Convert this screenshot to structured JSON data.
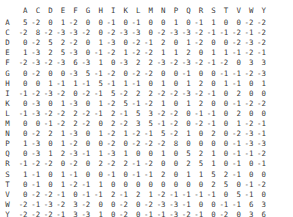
{
  "matrix": {
    "columns": [
      "A",
      "C",
      "D",
      "E",
      "F",
      "G",
      "H",
      "I",
      "K",
      "L",
      "M",
      "N",
      "P",
      "Q",
      "R",
      "S",
      "T",
      "V",
      "W",
      "Y"
    ],
    "rows": [
      {
        "label": "A",
        "values": [
          5,
          -2,
          0,
          1,
          -2,
          0,
          0,
          -1,
          0,
          -1,
          0,
          0,
          1,
          0,
          -1,
          1,
          0,
          0,
          -2,
          -2
        ]
      },
      {
        "label": "C",
        "values": [
          -2,
          8,
          -2,
          -3,
          -3,
          -2,
          0,
          -2,
          -3,
          -3,
          0,
          -2,
          -3,
          -3,
          -2,
          -1,
          -1,
          -2,
          -1,
          -2
        ]
      },
      {
        "label": "D",
        "values": [
          0,
          -2,
          5,
          2,
          -2,
          0,
          1,
          -3,
          0,
          -2,
          -1,
          2,
          0,
          1,
          -2,
          0,
          0,
          -2,
          -3,
          -2
        ]
      },
      {
        "label": "E",
        "values": [
          1,
          -3,
          2,
          5,
          -3,
          0,
          -1,
          -2,
          1,
          -2,
          -2,
          1,
          1,
          2,
          0,
          1,
          1,
          -1,
          -2,
          -1
        ]
      },
      {
        "label": "F",
        "values": [
          -2,
          -3,
          -2,
          -3,
          6,
          -3,
          1,
          0,
          -3,
          2,
          2,
          -3,
          -2,
          -3,
          -2,
          -1,
          -2,
          0,
          3,
          3
        ]
      },
      {
        "label": "G",
        "values": [
          0,
          -2,
          0,
          0,
          -3,
          5,
          -1,
          -2,
          0,
          -2,
          -2,
          0,
          0,
          -1,
          0,
          0,
          -1,
          -1,
          -2,
          -3
        ]
      },
      {
        "label": "H",
        "values": [
          0,
          0,
          1,
          -1,
          1,
          -1,
          5,
          -1,
          1,
          -1,
          0,
          1,
          0,
          1,
          2,
          0,
          1,
          -1,
          0,
          1
        ]
      },
      {
        "label": "I",
        "values": [
          -1,
          -2,
          -3,
          -2,
          0,
          -2,
          -1,
          5,
          -2,
          2,
          2,
          -2,
          -2,
          -3,
          -2,
          -1,
          0,
          2,
          0,
          0
        ]
      },
      {
        "label": "K",
        "values": [
          0,
          -3,
          0,
          1,
          -3,
          0,
          1,
          -2,
          5,
          -1,
          -2,
          1,
          0,
          1,
          2,
          0,
          0,
          -1,
          -2,
          -2
        ]
      },
      {
        "label": "L",
        "values": [
          -1,
          -3,
          -2,
          -2,
          2,
          -2,
          -1,
          2,
          -1,
          5,
          3,
          -2,
          -2,
          0,
          -1,
          -1,
          0,
          2,
          0,
          0
        ]
      },
      {
        "label": "M",
        "values": [
          0,
          0,
          -1,
          -2,
          2,
          -2,
          0,
          2,
          -2,
          3,
          5,
          -1,
          -2,
          0,
          -2,
          -1,
          0,
          1,
          -2,
          -1
        ]
      },
      {
        "label": "N",
        "values": [
          0,
          -2,
          2,
          1,
          -3,
          0,
          1,
          -2,
          1,
          -2,
          -1,
          5,
          -2,
          1,
          0,
          2,
          0,
          -2,
          -3,
          -1
        ]
      },
      {
        "label": "P",
        "values": [
          1,
          -3,
          0,
          1,
          -2,
          0,
          0,
          -2,
          0,
          -2,
          -2,
          -2,
          8,
          0,
          0,
          0,
          0,
          -1,
          -3,
          -3
        ]
      },
      {
        "label": "Q",
        "values": [
          0,
          -3,
          1,
          2,
          -3,
          -1,
          1,
          -3,
          1,
          0,
          0,
          1,
          0,
          5,
          2,
          1,
          0,
          -1,
          -1,
          -2
        ]
      },
      {
        "label": "R",
        "values": [
          -1,
          -2,
          -2,
          0,
          -2,
          0,
          2,
          -2,
          2,
          -1,
          -2,
          0,
          0,
          2,
          5,
          1,
          0,
          -1,
          0,
          -1
        ]
      },
      {
        "label": "S",
        "values": [
          1,
          -1,
          0,
          1,
          -1,
          0,
          0,
          -1,
          0,
          -1,
          -1,
          2,
          0,
          1,
          1,
          5,
          2,
          -1,
          0,
          0
        ]
      },
      {
        "label": "T",
        "values": [
          0,
          -1,
          0,
          1,
          -2,
          -1,
          1,
          0,
          0,
          0,
          0,
          0,
          0,
          0,
          0,
          2,
          5,
          0,
          -1,
          -2
        ]
      },
      {
        "label": "V",
        "values": [
          0,
          -2,
          -2,
          -1,
          0,
          -1,
          -1,
          2,
          -1,
          2,
          1,
          -2,
          -1,
          -1,
          -1,
          -1,
          0,
          5,
          -1,
          0
        ]
      },
      {
        "label": "W",
        "values": [
          -2,
          -1,
          -3,
          -2,
          3,
          -2,
          0,
          0,
          -2,
          0,
          -2,
          -3,
          -3,
          -1,
          0,
          0,
          -1,
          -1,
          6,
          3
        ]
      },
      {
        "label": "Y",
        "values": [
          -2,
          -2,
          -2,
          -1,
          3,
          -3,
          1,
          0,
          -2,
          0,
          -1,
          -1,
          -3,
          -2,
          -1,
          0,
          -2,
          0,
          3,
          6
        ]
      }
    ]
  }
}
